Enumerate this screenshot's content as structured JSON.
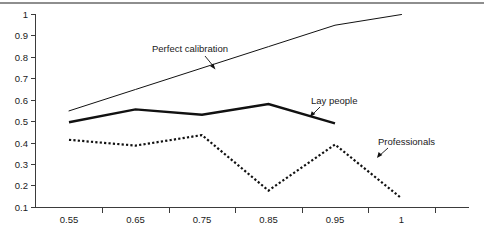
{
  "chart_data": {
    "type": "line",
    "title": "",
    "xlabel": "",
    "ylabel": "",
    "categories": [
      "0.55",
      "0.65",
      "0.75",
      "0.85",
      "0.95",
      "1"
    ],
    "x_tick_labels": [
      "0.55",
      "0.65",
      "0.75",
      "0.85",
      "0.95",
      "1"
    ],
    "y_tick_labels": [
      "1",
      "0.9",
      "0.8",
      "0.7",
      "0.6",
      "0.5",
      "0.4",
      "0.3",
      "0.2",
      "0.1"
    ],
    "ylim": [
      0.1,
      1.0
    ],
    "grid": false,
    "legend": "inline-annotations",
    "series": [
      {
        "name": "Perfect calibration",
        "style": "thin-solid",
        "color": "#111111",
        "values": [
          0.55,
          0.65,
          0.75,
          0.85,
          0.95,
          1.0
        ]
      },
      {
        "name": "Lay people",
        "style": "thick-solid",
        "color": "#111111",
        "values": [
          0.497,
          0.557,
          0.532,
          0.582,
          0.492,
          null
        ]
      },
      {
        "name": "Professionals",
        "style": "dotted",
        "color": "#111111",
        "values": [
          0.415,
          0.388,
          0.437,
          0.178,
          0.393,
          0.142
        ]
      }
    ],
    "annotations": [
      {
        "text": "Perfect calibration",
        "series": "Perfect calibration"
      },
      {
        "text": "Lay people",
        "series": "Lay people"
      },
      {
        "text": "Professionals",
        "series": "Professionals"
      }
    ]
  }
}
